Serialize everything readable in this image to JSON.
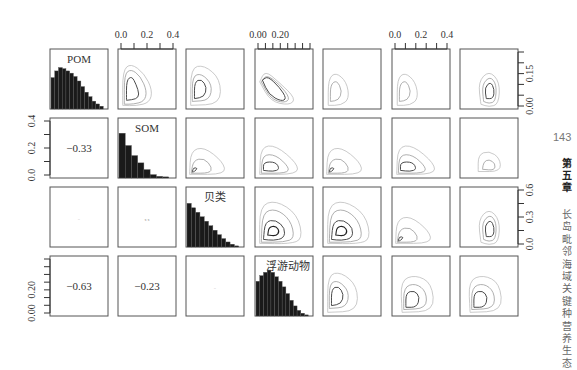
{
  "page": {
    "number": "143",
    "chapter": "第五章",
    "running_title": "长岛毗邻海域关键种营养生态"
  },
  "chart_data": {
    "type": "scatterplot-matrix",
    "rows": 4,
    "cols": 7,
    "variables": [
      "POM",
      "SOM",
      "贝类",
      "浮游动物"
    ],
    "diagonal_labels": [
      "POM",
      "SOM",
      "贝类",
      "浮游动物"
    ],
    "correlations": [
      {
        "row": 1,
        "col": 0,
        "text": "-0.33",
        "size": "large"
      },
      {
        "row": 2,
        "col": 0,
        "text": "-",
        "size": "small"
      },
      {
        "row": 2,
        "col": 1,
        "text": "x x",
        "size": "small"
      },
      {
        "row": 3,
        "col": 0,
        "text": "-0.63",
        "size": "large"
      },
      {
        "row": 3,
        "col": 1,
        "text": "-0.23",
        "size": "large"
      },
      {
        "row": 3,
        "col": 2,
        "text": "-",
        "size": "small"
      }
    ],
    "histograms": {
      "POM": [
        0.56,
        0.68,
        0.74,
        0.72,
        0.68,
        0.64,
        0.58,
        0.5,
        0.4,
        0.3,
        0.22,
        0.14,
        0.09,
        0.05
      ],
      "SOM": [
        0.8,
        0.58,
        0.4,
        0.27,
        0.15,
        0.06,
        0.03,
        0.02
      ],
      "贝类": [
        0.78,
        0.7,
        0.62,
        0.54,
        0.46,
        0.38,
        0.3,
        0.22,
        0.15,
        0.09,
        0.05,
        0.02
      ],
      "浮游动物": [
        0.62,
        0.72,
        0.78,
        0.82,
        0.78,
        0.7,
        0.62,
        0.52,
        0.4,
        0.28,
        0.18,
        0.1,
        0.05,
        0.02
      ]
    },
    "top_axes": [
      {
        "col": 1,
        "ticks": [
          "0.0",
          "0.2",
          "0.4"
        ],
        "minor_ticks": 5
      },
      {
        "col": 3,
        "ticks": [
          "0.00",
          "0.20"
        ],
        "minor_ticks": 8
      },
      {
        "col": 5,
        "ticks": [
          "0.0",
          "0.2",
          "0.4"
        ],
        "minor_ticks": 6
      }
    ],
    "left_axes": [
      {
        "row": 1,
        "ticks": [
          "0.0",
          "0.2",
          "0.4"
        ],
        "minor_ticks": 5
      },
      {
        "row": 3,
        "ticks": [
          "0.00",
          "0.20"
        ],
        "minor_ticks": 8
      }
    ],
    "right_axes": [
      {
        "row": 0,
        "ticks": [
          "0.00",
          "0.15"
        ],
        "minor_ticks": 6
      },
      {
        "row": 2,
        "ticks": [
          "0.0",
          "0.3",
          "0.6"
        ],
        "minor_ticks": 5
      }
    ],
    "grid": false,
    "legend": "none"
  }
}
